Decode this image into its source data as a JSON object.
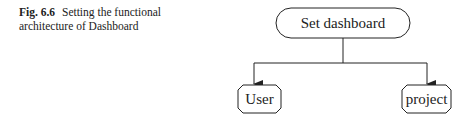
{
  "caption": {
    "label": "Fig. 6.6",
    "text": "Setting the functional architecture of Dashboard"
  },
  "diagram": {
    "root": {
      "label": "Set dashboard"
    },
    "children": [
      {
        "label": "User"
      },
      {
        "label": "project"
      }
    ],
    "stroke_color": "#222222"
  }
}
